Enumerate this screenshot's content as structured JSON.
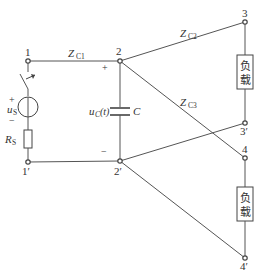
{
  "diagram": {
    "type": "circuit",
    "nodes": {
      "n1": "1",
      "n1p": "1′",
      "n2": "2",
      "n2p": "2′",
      "n3": "3",
      "n3p": "3′",
      "n4": "4",
      "n4p": "4′"
    },
    "lines": {
      "zc1": {
        "main": "Z",
        "sub": "C1"
      },
      "zc2": {
        "main": "Z",
        "sub": "C2"
      },
      "zc3": {
        "main": "Z",
        "sub": "C3"
      }
    },
    "source": {
      "voltage_main": "u",
      "voltage_sub": "S",
      "plus": "+",
      "minus": "−",
      "resistor_main": "R",
      "resistor_sub": "S"
    },
    "capacitor": {
      "label": "C",
      "voltage_main": "u",
      "voltage_sub": "C",
      "voltage_arg": "(t)",
      "plus": "+",
      "minus": "−"
    },
    "loads": [
      {
        "char1": "负",
        "char2": "载"
      },
      {
        "char1": "负",
        "char2": "载"
      }
    ]
  }
}
